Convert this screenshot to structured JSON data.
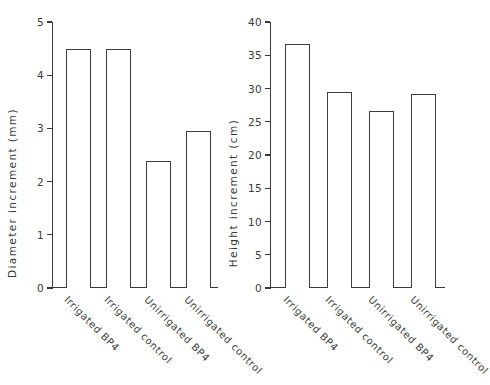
{
  "chart_data": [
    {
      "type": "bar",
      "panel": "left",
      "title": "",
      "xlabel": "",
      "ylabel": "Diameter increment (mm)",
      "categories": [
        "Irrigated BP4",
        "Irrigated control",
        "Unirrigated BP4",
        "Unirrigated control"
      ],
      "values": [
        4.5,
        4.5,
        2.38,
        2.95
      ],
      "ylim": [
        0,
        5
      ],
      "yticks": [
        0,
        1,
        2,
        3,
        4,
        5
      ],
      "ytick_labels": [
        "0",
        "1",
        "2",
        "3",
        "4",
        "5"
      ],
      "grid": false,
      "legend": false
    },
    {
      "type": "bar",
      "panel": "right",
      "title": "",
      "xlabel": "",
      "ylabel": "Height increment (cm)",
      "categories": [
        "Irrigated BP4",
        "Irrigated control",
        "Unirrigated BP4",
        "Unirrigated control"
      ],
      "values": [
        36.7,
        29.5,
        26.6,
        29.2
      ],
      "ylim": [
        0,
        40
      ],
      "yticks": [
        0,
        5,
        10,
        15,
        20,
        25,
        30,
        35,
        40
      ],
      "ytick_labels": [
        "0",
        "5",
        "10",
        "15",
        "20",
        "25",
        "30",
        "35",
        "40"
      ],
      "grid": false,
      "legend": false
    }
  ],
  "style": {
    "bar_fill": "#ffffff",
    "bar_stroke": "#3f3f3f",
    "axis_color": "#3a3a3a",
    "background": "#ffffff"
  }
}
